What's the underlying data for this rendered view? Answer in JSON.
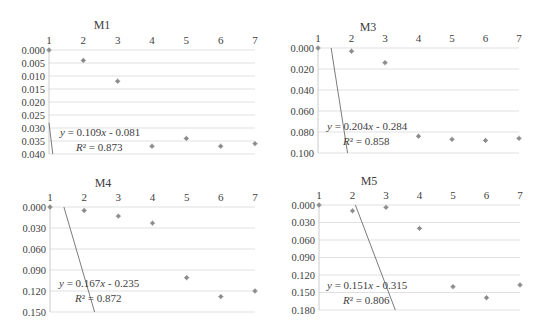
{
  "chart_data": [
    {
      "type": "scatter",
      "title": "M1",
      "x": [
        1,
        2,
        3,
        4,
        5,
        6,
        7
      ],
      "values": [
        0.0,
        0.004,
        0.012,
        0.037,
        0.034,
        0.037,
        0.036
      ],
      "xticks": [
        "1",
        "2",
        "3",
        "4",
        "5",
        "6",
        "7"
      ],
      "yticks": [
        "0.000",
        "0.005",
        "0.010",
        "0.015",
        "0.020",
        "0.025",
        "0.030",
        "0.035",
        "0.040"
      ],
      "ylim": [
        0.0,
        0.04
      ],
      "y_inverted": true,
      "xaxis_position": "top",
      "trendline": {
        "slope": 0.109,
        "intercept": -0.081,
        "equation": "y = 0.109x - 0.081",
        "r2": "R² = 0.873"
      },
      "grid": true,
      "xlabel": "",
      "ylabel": ""
    },
    {
      "type": "scatter",
      "title": "M3",
      "x": [
        1,
        2,
        3,
        4,
        5,
        6,
        7
      ],
      "values": [
        0.0,
        0.003,
        0.014,
        0.084,
        0.087,
        0.088,
        0.086
      ],
      "xticks": [
        "1",
        "2",
        "3",
        "4",
        "5",
        "6",
        "7"
      ],
      "yticks": [
        "0.000",
        "0.020",
        "0.040",
        "0.060",
        "0.080",
        "0.100"
      ],
      "ylim": [
        0.0,
        0.1
      ],
      "y_inverted": true,
      "xaxis_position": "top",
      "trendline": {
        "slope": 0.204,
        "intercept": -0.284,
        "equation": "y = 0.204x - 0.284",
        "r2": "R² = 0.858"
      },
      "grid": true,
      "xlabel": "",
      "ylabel": ""
    },
    {
      "type": "scatter",
      "title": "M4",
      "x": [
        1,
        2,
        3,
        4,
        5,
        6,
        7
      ],
      "values": [
        0.0,
        0.005,
        0.013,
        0.023,
        0.101,
        0.128,
        0.12
      ],
      "xticks": [
        "1",
        "2",
        "3",
        "4",
        "5",
        "6",
        "7"
      ],
      "yticks": [
        "0.000",
        "0.030",
        "0.060",
        "0.090",
        "0.120",
        "0.150"
      ],
      "ylim": [
        0.0,
        0.15
      ],
      "y_inverted": true,
      "xaxis_position": "top",
      "trendline": {
        "slope": 0.167,
        "intercept": -0.235,
        "equation": "y = 0.167x - 0.235",
        "r2": "R² = 0.872"
      },
      "grid": true,
      "xlabel": "",
      "ylabel": ""
    },
    {
      "type": "scatter",
      "title": "M5",
      "x": [
        1,
        2,
        3,
        4,
        5,
        6,
        7
      ],
      "values": [
        0.0,
        0.01,
        0.004,
        0.04,
        0.14,
        0.159,
        0.137
      ],
      "xticks": [
        "1",
        "2",
        "3",
        "4",
        "5",
        "6",
        "7"
      ],
      "yticks": [
        "0.000",
        "0.030",
        "0.060",
        "0.090",
        "0.120",
        "0.150",
        "0.180"
      ],
      "ylim": [
        0.0,
        0.18
      ],
      "y_inverted": true,
      "xaxis_position": "top",
      "trendline": {
        "slope": 0.151,
        "intercept": -0.315,
        "equation": "y = 0.151x - 0.315",
        "r2": "R² = 0.806"
      },
      "grid": true,
      "xlabel": "",
      "ylabel": ""
    }
  ],
  "layout": {
    "panels": [
      {
        "left": 0,
        "top": 0,
        "plot": {
          "x0": 49,
          "x1": 255,
          "y0": 50,
          "y1": 154
        },
        "title_x": 102,
        "title_y": 20,
        "eq_x": 60,
        "eq_y": 126
      },
      {
        "left": 271,
        "top": 0,
        "plot": {
          "x0": 318,
          "x1": 519,
          "y0": 48,
          "y1": 153
        },
        "title_x": 368,
        "title_y": 22,
        "eq_x": 327,
        "eq_y": 120
      },
      {
        "left": 0,
        "top": 168,
        "plot": {
          "x0": 50,
          "x1": 255,
          "y0": 207,
          "y1": 312
        },
        "title_x": 103,
        "title_y": 178,
        "eq_x": 59,
        "eq_y": 277
      },
      {
        "left": 271,
        "top": 168,
        "plot": {
          "x0": 319,
          "x1": 520,
          "y0": 205,
          "y1": 310
        },
        "title_x": 369,
        "title_y": 176,
        "eq_x": 327,
        "eq_y": 279
      }
    ],
    "colors": {
      "grid": "#d9d9d9",
      "axis": "#bfbfbf",
      "marker": "#8c8c8c",
      "trend": "#595959",
      "text": "#404040"
    }
  }
}
